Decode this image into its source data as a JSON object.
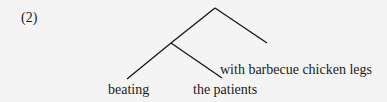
{
  "example_number": "(2)",
  "tree": {
    "root": {
      "children": [
        {
          "node": "inner",
          "children": [
            {
              "leaf": "beating"
            },
            {
              "leaf": "the patients"
            }
          ]
        },
        {
          "leaf": "with barbecue chicken legs"
        }
      ]
    }
  },
  "labels": {
    "beating": "beating",
    "the_patients": "the patients",
    "with_pp": "with barbecue chicken legs"
  }
}
